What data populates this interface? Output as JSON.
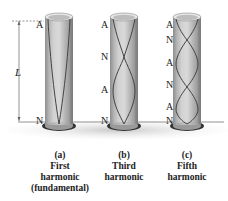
{
  "dimension": {
    "label": "L"
  },
  "tubes": [
    {
      "id": "a",
      "labels": [
        "A",
        "N"
      ],
      "caption": {
        "letter": "(a)",
        "line1": "First",
        "line2": "harmonic",
        "line3": "(fundamental)"
      }
    },
    {
      "id": "b",
      "labels": [
        "A",
        "N",
        "A",
        "N"
      ],
      "caption": {
        "letter": "(b)",
        "line1": "Third",
        "line2": "harmonic"
      }
    },
    {
      "id": "c",
      "labels": [
        "A",
        "N",
        "A",
        "N",
        "A",
        "N"
      ],
      "caption": {
        "letter": "(c)",
        "line1": "Fifth",
        "line2": "harmonic"
      }
    }
  ],
  "colors": {
    "tube_light": "#d8d8d8",
    "tube_dark": "#8a8a8a",
    "wave": "#4a4a4a",
    "floor": "#b8b8b8",
    "text": "#222222"
  }
}
